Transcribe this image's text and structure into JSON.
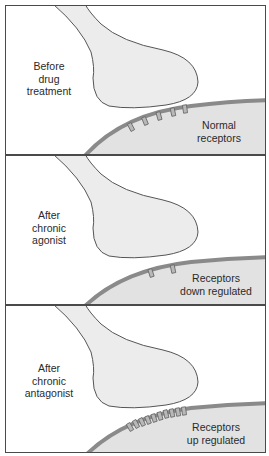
{
  "figure": {
    "colors": {
      "border": "#4a4a4a",
      "terminal_fill": "#ececec",
      "cell_fill": "#e2e2e2",
      "membrane": "#8a8a8a",
      "receptor_fill": "#b8b8b8",
      "text": "#2a2a2a"
    },
    "panels": [
      {
        "stage_label_lines": [
          "Before",
          "drug",
          "treatment"
        ],
        "receptor_label_lines": [
          "Normal",
          "receptors"
        ],
        "receptor_count": 5,
        "state": "normal"
      },
      {
        "stage_label_lines": [
          "After",
          "chronic",
          "agonist"
        ],
        "receptor_label_lines": [
          "Receptors",
          "down regulated"
        ],
        "receptor_count": 2,
        "state": "down regulated"
      },
      {
        "stage_label_lines": [
          "After",
          "chronic",
          "antagonist"
        ],
        "receptor_label_lines": [
          "Receptors",
          "up regulated"
        ],
        "receptor_count": 10,
        "state": "up regulated"
      }
    ]
  }
}
